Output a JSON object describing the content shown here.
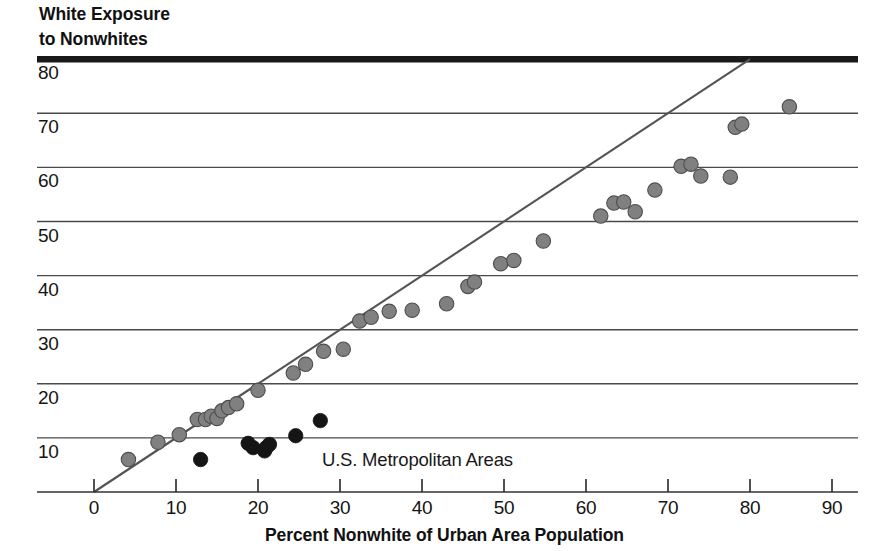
{
  "chart_data": {
    "type": "scatter",
    "title": "",
    "ylabel": "White Exposure\nto Nonwhites",
    "xlabel": "Percent Nonwhite of Urban Area Population",
    "annotation": "U.S. Metropolitan Areas",
    "xlim": [
      -3,
      94
    ],
    "ylim": [
      -1.5,
      82
    ],
    "xticks": [
      0,
      10,
      20,
      30,
      40,
      50,
      60,
      70,
      80,
      90
    ],
    "yticks": [
      10,
      20,
      30,
      40,
      50,
      60,
      70,
      80
    ],
    "grid": "horizontal",
    "legend": "none",
    "reference_line": {
      "name": "parity-line",
      "description": "y = x diagonal",
      "x0": 0,
      "y0": 0,
      "x1": 80,
      "y1": 80,
      "color": "#545454"
    },
    "colors": {
      "gray_point": "#808080",
      "gray_point_edge": "#4d4d4d",
      "black_point": "#151515",
      "gridline": "#4a4a4a",
      "axis": "#333333",
      "top_rule": "#1a1a1a"
    },
    "series": [
      {
        "name": "Metropolitan areas (gray)",
        "marker": "filled-circle",
        "color": "#808080",
        "points": [
          [
            4.2,
            6.0
          ],
          [
            7.8,
            9.2
          ],
          [
            10.4,
            10.6
          ],
          [
            12.6,
            13.4
          ],
          [
            13.6,
            13.4
          ],
          [
            14.3,
            14.0
          ],
          [
            15.0,
            13.6
          ],
          [
            15.6,
            15.0
          ],
          [
            16.4,
            15.6
          ],
          [
            17.4,
            16.3
          ],
          [
            20.0,
            18.8
          ],
          [
            24.3,
            22.0
          ],
          [
            25.8,
            23.6
          ],
          [
            28.0,
            26.0
          ],
          [
            30.4,
            26.4
          ],
          [
            32.4,
            31.6
          ],
          [
            33.8,
            32.3
          ],
          [
            36.0,
            33.4
          ],
          [
            38.8,
            33.6
          ],
          [
            43.0,
            34.8
          ],
          [
            45.6,
            38.0
          ],
          [
            46.4,
            38.8
          ],
          [
            49.6,
            42.2
          ],
          [
            51.2,
            42.8
          ],
          [
            54.8,
            46.4
          ],
          [
            61.8,
            51.0
          ],
          [
            63.4,
            53.4
          ],
          [
            64.6,
            53.6
          ],
          [
            66.0,
            51.8
          ],
          [
            68.4,
            55.8
          ],
          [
            71.6,
            60.2
          ],
          [
            72.8,
            60.6
          ],
          [
            74.0,
            58.4
          ],
          [
            77.6,
            58.2
          ],
          [
            78.2,
            67.4
          ],
          [
            79.0,
            68.0
          ],
          [
            84.8,
            71.2
          ]
        ]
      },
      {
        "name": "Highly segregated areas (black)",
        "marker": "filled-circle",
        "color": "#151515",
        "points": [
          [
            13.0,
            6.0
          ],
          [
            18.8,
            9.0
          ],
          [
            19.4,
            8.2
          ],
          [
            20.8,
            7.6
          ],
          [
            21.0,
            8.2
          ],
          [
            21.4,
            8.8
          ],
          [
            24.6,
            10.4
          ],
          [
            27.6,
            13.2
          ]
        ]
      }
    ]
  },
  "axes": {
    "y_tick_labels": [
      "80",
      "70",
      "60",
      "50",
      "40",
      "30",
      "20",
      "10"
    ],
    "x_tick_labels": [
      "0",
      "10",
      "20",
      "30",
      "40",
      "50",
      "60",
      "70",
      "80",
      "90"
    ]
  }
}
